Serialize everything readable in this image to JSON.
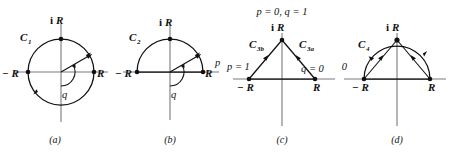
{
  "figure": {
    "panels": [
      {
        "id": "a",
        "caption": "(a)",
        "contour_label": "C",
        "contour_sub": "1",
        "axis_labels": {
          "right": "R",
          "left": "− R",
          "top": "i",
          "top_italic": "R"
        },
        "angle_label": "q",
        "shape": "full-circle",
        "radius_angle_deg": 30
      },
      {
        "id": "b",
        "caption": "(b)",
        "contour_label": "C",
        "contour_sub": "2",
        "axis_labels": {
          "right": "R",
          "left": "− R",
          "top": "i",
          "top_italic": "R"
        },
        "angle_label": "q",
        "param_label": "p",
        "shape": "upper-semicircle",
        "radius_angle_deg": 30
      },
      {
        "id": "c",
        "caption": "(c)",
        "title": "p = 0, q = 1",
        "contour_label_left": "C",
        "contour_sub_left": "3b",
        "contour_label_right": "C",
        "contour_sub_right": "3a",
        "axis_labels": {
          "right": "R",
          "left": "− R",
          "top": "i",
          "top_italic": "R"
        },
        "left_param": "p = 1",
        "right_param": "q = 0",
        "shape": "triangle"
      },
      {
        "id": "d",
        "caption": "(d)",
        "contour_label": "C",
        "contour_sub": "4",
        "axis_labels": {
          "right": "R",
          "left": "− R",
          "top": "i",
          "top_italic": "R"
        },
        "param_label": "= 0",
        "shape": "semicircle-with-chords"
      }
    ]
  }
}
